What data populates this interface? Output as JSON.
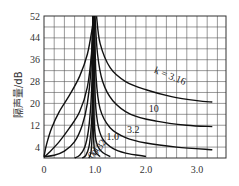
{
  "chart_data": {
    "type": "line",
    "title": "",
    "xlabel": "",
    "ylabel": "隔声量/dB",
    "xlim": [
      0,
      3.6
    ],
    "ylim": [
      0,
      52
    ],
    "grid": true,
    "x_ticks": [
      0,
      1.0,
      2.0,
      3.0
    ],
    "x_tick_labels": [
      "0",
      "1.0",
      "2.0",
      "3.0"
    ],
    "y_ticks": [
      4,
      12,
      20,
      28,
      36,
      44,
      52
    ],
    "y_tick_labels": [
      "4",
      "12",
      "20",
      "28",
      "36",
      "44",
      "52"
    ],
    "legend_position": "inline curve labels",
    "annotations": [
      "k = 3.16",
      "10",
      "3.2",
      "1.0",
      "0.32",
      "0.1"
    ],
    "series": [
      {
        "name": "k=3.16",
        "label": "k = 3.16",
        "label_pos": [
          2.45,
          29
        ],
        "points": [
          [
            1.03,
            52
          ],
          [
            1.1,
            42
          ],
          [
            1.3,
            33
          ],
          [
            1.6,
            28
          ],
          [
            2.0,
            25
          ],
          [
            2.5,
            22.5
          ],
          [
            3.0,
            21
          ],
          [
            3.3,
            20.5
          ]
        ]
      },
      {
        "name": "k=10",
        "label": "10",
        "label_pos": [
          2.15,
          17
        ],
        "points": [
          [
            1.0,
            52
          ],
          [
            1.05,
            38
          ],
          [
            1.15,
            28
          ],
          [
            1.35,
            21
          ],
          [
            1.7,
            16
          ],
          [
            2.2,
            13.5
          ],
          [
            2.8,
            12
          ],
          [
            3.3,
            11.5
          ]
        ]
      },
      {
        "name": "k=3.2",
        "label": "3.2",
        "label_pos": [
          1.75,
          9
        ],
        "points": [
          [
            0.99,
            52
          ],
          [
            1.02,
            30
          ],
          [
            1.1,
            18
          ],
          [
            1.3,
            11
          ],
          [
            1.6,
            7.5
          ],
          [
            2.0,
            5.5
          ],
          [
            2.6,
            4
          ],
          [
            3.3,
            3
          ]
        ]
      },
      {
        "name": "k=1.0",
        "label": "1.0",
        "label_pos": [
          1.35,
          6.5
        ],
        "points": [
          [
            0.98,
            52
          ],
          [
            1.0,
            24
          ],
          [
            1.05,
            13
          ],
          [
            1.15,
            7
          ],
          [
            1.35,
            3.5
          ],
          [
            1.6,
            1.8
          ],
          [
            2.0,
            0.6
          ]
        ]
      },
      {
        "name": "k=0.32",
        "label": "0.32",
        "label_pos": [
          1.13,
          3.2
        ],
        "points": [
          [
            0.97,
            52
          ],
          [
            0.98,
            18
          ],
          [
            1.0,
            9
          ],
          [
            1.05,
            4.5
          ],
          [
            1.15,
            2
          ],
          [
            1.3,
            0.5
          ]
        ]
      },
      {
        "name": "k=0.1",
        "label": "0.1",
        "label_pos": [
          1.02,
          1.5
        ],
        "points": [
          [
            0.96,
            52
          ],
          [
            0.965,
            14
          ],
          [
            0.975,
            6
          ],
          [
            1.0,
            2.5
          ],
          [
            1.1,
            0.5
          ]
        ]
      },
      {
        "name": "left-1",
        "label": "",
        "points": [
          [
            0.0,
            0.5
          ],
          [
            0.05,
            5
          ],
          [
            0.15,
            11
          ],
          [
            0.3,
            17
          ],
          [
            0.5,
            23
          ],
          [
            0.7,
            30
          ],
          [
            0.85,
            38
          ],
          [
            0.95,
            48
          ],
          [
            0.98,
            52
          ]
        ]
      },
      {
        "name": "left-2",
        "label": "",
        "points": [
          [
            0.0,
            0.3
          ],
          [
            0.1,
            2
          ],
          [
            0.3,
            6
          ],
          [
            0.5,
            11
          ],
          [
            0.7,
            17
          ],
          [
            0.85,
            26
          ],
          [
            0.93,
            38
          ],
          [
            0.97,
            52
          ]
        ]
      },
      {
        "name": "left-3",
        "label": "",
        "points": [
          [
            0.0,
            0.5
          ],
          [
            0.2,
            1
          ],
          [
            0.4,
            2.5
          ],
          [
            0.6,
            6
          ],
          [
            0.75,
            12
          ],
          [
            0.85,
            20
          ],
          [
            0.92,
            32
          ],
          [
            0.96,
            52
          ]
        ]
      },
      {
        "name": "left-4",
        "label": "",
        "points": [
          [
            0.6,
            0
          ],
          [
            0.7,
            1
          ],
          [
            0.8,
            4
          ],
          [
            0.87,
            10
          ],
          [
            0.92,
            20
          ],
          [
            0.95,
            34
          ],
          [
            0.965,
            52
          ]
        ]
      },
      {
        "name": "left-5",
        "label": "",
        "points": [
          [
            0.75,
            0
          ],
          [
            0.82,
            1
          ],
          [
            0.88,
            4
          ],
          [
            0.92,
            10
          ],
          [
            0.95,
            22
          ],
          [
            0.96,
            52
          ]
        ]
      },
      {
        "name": "left-6",
        "label": "",
        "points": [
          [
            0.88,
            0
          ],
          [
            0.92,
            2
          ],
          [
            0.94,
            7
          ],
          [
            0.955,
            18
          ],
          [
            0.96,
            52
          ]
        ]
      }
    ]
  }
}
